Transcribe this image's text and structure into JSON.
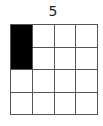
{
  "label": "5",
  "grid": {
    "rows": 4,
    "cols": 4,
    "filled_cells": [
      [
        0,
        0
      ],
      [
        1,
        0
      ]
    ],
    "fill_color": "#000000",
    "empty_color": "#ffffff",
    "line_color": "#555555"
  }
}
